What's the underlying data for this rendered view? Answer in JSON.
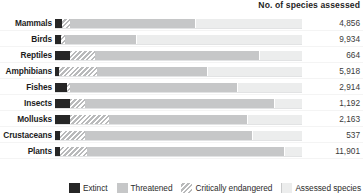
{
  "header": {
    "value_column_title": "No. of species assessed"
  },
  "legend": {
    "items": [
      {
        "key": "extinct",
        "label": "Extinct",
        "swatch": "solid-dark-swatch",
        "color": "#262626"
      },
      {
        "key": "threatened",
        "label": "Threatened",
        "swatch": "solid-gray-swatch",
        "color": "#c6c7c8"
      },
      {
        "key": "critical",
        "label": "Critically endangered",
        "swatch": "hatched-gray-swatch",
        "color": "#b9babb"
      },
      {
        "key": "assessed",
        "label": "Assessed species",
        "swatch": "light-track-swatch",
        "color": "#eceded"
      }
    ]
  },
  "chart_data": {
    "type": "bar",
    "title": "",
    "subtitle": "",
    "xlabel": "",
    "ylabel": "",
    "orientation": "horizontal",
    "stacked": true,
    "grid": false,
    "legend_position": "bottom-right",
    "xlim": [
      0,
      100
    ],
    "x_unit": "percent of assessed species",
    "categories": [
      "Mammals",
      "Birds",
      "Reptiles",
      "Amphibians",
      "Fishes",
      "Insects",
      "Mollusks",
      "Crustaceans",
      "Plants"
    ],
    "value_column_label": "No. of species assessed",
    "assessed_counts": [
      "4,856",
      "9,934",
      "664",
      "5,918",
      "2,914",
      "1,192",
      "2,163",
      "537",
      "11,901"
    ],
    "series": [
      {
        "name": "Extinct",
        "color": "#262626",
        "values": [
          3,
          2.5,
          6,
          1.5,
          5,
          6,
          6,
          2,
          2
        ]
      },
      {
        "name": "Critically endangered",
        "color": "#b9babb",
        "values": [
          6,
          4,
          16,
          17,
          6,
          12,
          22,
          12,
          13
        ]
      },
      {
        "name": "Threatened",
        "color": "#c6c7c8",
        "values": [
          57,
          33,
          83,
          62,
          74,
          89,
          78,
          80,
          93
        ]
      },
      {
        "name": "Assessed species",
        "color": "#eceded",
        "values": [
          100,
          100,
          100,
          100,
          100,
          100,
          100,
          100,
          100
        ]
      }
    ]
  },
  "rows": [
    {
      "label": "Mammals",
      "value": "4,856",
      "extinct_pct": 3,
      "critical_pct": 6,
      "threatened_pct": 57
    },
    {
      "label": "Birds",
      "value": "9,934",
      "extinct_pct": 2.5,
      "critical_pct": 4,
      "threatened_pct": 33
    },
    {
      "label": "Reptiles",
      "value": "664",
      "extinct_pct": 6,
      "critical_pct": 16,
      "threatened_pct": 83
    },
    {
      "label": "Amphibians",
      "value": "5,918",
      "extinct_pct": 1.5,
      "critical_pct": 17,
      "threatened_pct": 62
    },
    {
      "label": "Fishes",
      "value": "2,914",
      "extinct_pct": 5,
      "critical_pct": 6,
      "threatened_pct": 74
    },
    {
      "label": "Insects",
      "value": "1,192",
      "extinct_pct": 6,
      "critical_pct": 12,
      "threatened_pct": 89
    },
    {
      "label": "Mollusks",
      "value": "2,163",
      "extinct_pct": 6,
      "critical_pct": 22,
      "threatened_pct": 78
    },
    {
      "label": "Crustaceans",
      "value": "537",
      "extinct_pct": 2,
      "critical_pct": 12,
      "threatened_pct": 80
    },
    {
      "label": "Plants",
      "value": "11,901",
      "extinct_pct": 2,
      "critical_pct": 13,
      "threatened_pct": 93
    }
  ]
}
